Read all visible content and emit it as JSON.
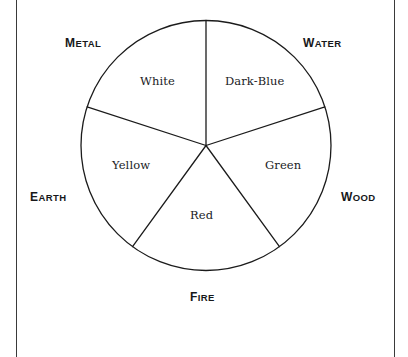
{
  "figure": {
    "geometry": {
      "center_x": 206,
      "center_y": 145.5,
      "radius": 125,
      "sector_count": 5,
      "sector_degrees": 72,
      "first_spoke_degrees": 0,
      "stroke_color": "#1b1b1b",
      "stroke_width": 1.3,
      "fill_color": "#ffffff"
    },
    "frame": {
      "left_rule_x": 16,
      "right_rule_x": 394,
      "rule_color": "#3a3a3a"
    }
  },
  "elements": [
    {
      "name": "WATER",
      "cap": "W",
      "rest": "ATER",
      "x": 303,
      "y": 34,
      "angle_degrees": 36
    },
    {
      "name": "WOOD",
      "cap": "W",
      "rest": "OOD",
      "x": 341,
      "y": 188,
      "angle_degrees": 108
    },
    {
      "name": "FIRE",
      "cap": "F",
      "rest": "IRE",
      "x": 190,
      "y": 288,
      "angle_degrees": 180
    },
    {
      "name": "EARTH",
      "cap": "E",
      "rest": "ARTH",
      "x": 30,
      "y": 188,
      "angle_degrees": 252
    },
    {
      "name": "METAL",
      "cap": "M",
      "rest": "ETAL",
      "x": 65,
      "y": 34,
      "angle_degrees": 324
    }
  ],
  "colors": [
    {
      "name": "Dark-Blue",
      "x": 225,
      "y": 76,
      "element": "WATER"
    },
    {
      "name": "Green",
      "x": 265,
      "y": 160,
      "element": "WOOD"
    },
    {
      "name": "Red",
      "x": 190,
      "y": 210,
      "element": "FIRE"
    },
    {
      "name": "Yellow",
      "x": 112,
      "y": 160,
      "element": "EARTH"
    },
    {
      "name": "White",
      "x": 140,
      "y": 76,
      "element": "METAL"
    }
  ],
  "chart_data": {
    "type": "pie",
    "categories": [
      "WATER",
      "WOOD",
      "FIRE",
      "EARTH",
      "METAL"
    ],
    "values": [
      72,
      72,
      72,
      72,
      72
    ],
    "labels": [
      "Dark-Blue",
      "Green",
      "Red",
      "Yellow",
      "White"
    ],
    "xlabel": "",
    "ylabel": "",
    "legend": "none",
    "grid": false
  }
}
